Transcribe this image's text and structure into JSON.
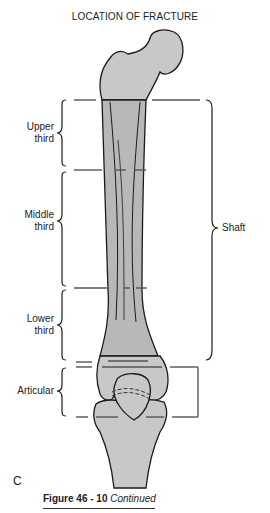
{
  "title": "LOCATION OF FRACTURE",
  "regions": {
    "upper": {
      "line1": "Upper",
      "line2": "third"
    },
    "middle": {
      "line1": "Middle",
      "line2": "third"
    },
    "lower": {
      "line1": "Lower",
      "line2": "third"
    },
    "articular": "Articular",
    "shaft": "Shaft"
  },
  "panel_letter": "C",
  "caption": {
    "figure": "Figure 46 - 10",
    "note": "Continued"
  },
  "colors": {
    "bone_fill": "#c8c8c8",
    "shaft_shade": "#b4b4b4",
    "outline": "#1a1a1a",
    "marker": "#555555"
  }
}
